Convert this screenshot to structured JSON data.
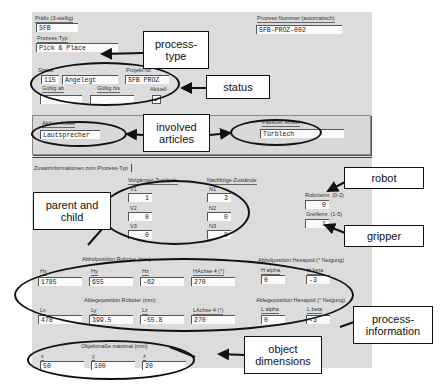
{
  "header": {
    "prefix_label": "Präfix (3-stellig)",
    "prefix_value": "SFB",
    "process_type_label": "Prozess-Typ",
    "process_type_value": "Pick & Place",
    "process_number_label": "Prozess-Nummer (automatisch)",
    "process_number_value": "SFB-PROZ-002"
  },
  "status": {
    "status_label": "Status",
    "status_code": "115",
    "status_text": "Angelegt",
    "project_label": "Projekt-Nr.",
    "project_value": "SFB PROZ",
    "valid_from_label": "Gültig ab",
    "valid_from_value": "",
    "valid_to_label": "Gültig bis",
    "valid_to_value": "",
    "current_label": "Aktuell",
    "current_checked": "✓"
  },
  "articles": {
    "active_label": "Aktiver Artikel",
    "active_value": "Lautsprecher",
    "passive_label": "Passiver Artikel",
    "passive_value": "Türblech"
  },
  "tab": {
    "label": "Zusatzinformationen zum Prozess-Typ"
  },
  "states": {
    "predecessor_title": "Vorgänger-Zustände",
    "successor_title": "Nachfolge-Zustände",
    "v1_label": "V1",
    "v1_value": "1",
    "v2_label": "V2",
    "v2_value": "0",
    "v3_label": "V3",
    "v3_value": "0",
    "n1_label": "N1",
    "n1_value": "3",
    "n2_label": "N2",
    "n2_value": "0",
    "n3_label": "N3",
    "n3_value": "0"
  },
  "robot": {
    "robot_label": "Roboternr. (0-2)",
    "robot_value": "0",
    "gripper_label": "Greifernr. (1-5)",
    "gripper_value": "1"
  },
  "pickup": {
    "title": "Abholposition Roboter (mm)",
    "hx_label": "Hx",
    "hx_value": "1785",
    "hy_label": "Hy",
    "hy_value": "655",
    "hz_label": "Hz",
    "hz_value": "-62",
    "ha4_label": "HAchse 4 (°)",
    "ha4_value": "270",
    "hexapod_title": "Abholposition Hexapod (° Neigung)",
    "halpha_label": "H alpha",
    "halpha_value": "0",
    "hbeta_label": "H beta",
    "hbeta_value": "-3"
  },
  "place": {
    "title": "Ablegeposition Roboter (mm)",
    "lx_label": "Lx",
    "lx_value": "478",
    "ly_label": "Ly",
    "ly_value": "399.5",
    "lz_label": "Lz",
    "lz_value": "-55.8",
    "la4_label": "LAchse 4 (°)",
    "la4_value": "270",
    "hexapod_title": "Ablegeposition Hexapod (° Neigung)",
    "lalpha_label": "L alpha",
    "lalpha_value": "0",
    "lbeta_label": "L beta",
    "lbeta_value": "-3"
  },
  "object": {
    "title": "Objektmaße maximal (mm)",
    "x_label": "x",
    "x_value": "50",
    "y_label": "y",
    "y_value": "100",
    "z_label": "z",
    "z_value": "20"
  },
  "callouts": {
    "process_type": "process-\ntype",
    "status": "status",
    "articles": "involved\narticles",
    "parent_child": "parent and\nchild",
    "robot": "robot",
    "gripper": "gripper",
    "process_info": "process-\ninformation",
    "object_dims": "object\ndimensions"
  }
}
